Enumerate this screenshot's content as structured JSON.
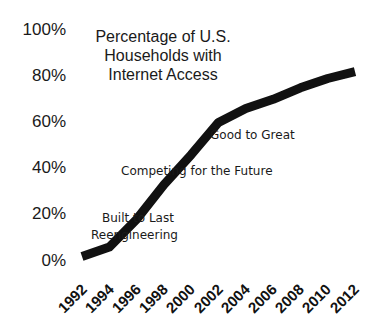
{
  "chart_data": {
    "type": "line",
    "title": "Percentage of U.S. Households with Internet Access",
    "title_lines": [
      "Percentage of U.S.",
      "Households with",
      "Internet Access"
    ],
    "xlabel": "",
    "ylabel": "",
    "x": [
      1992,
      1994,
      1996,
      1998,
      2000,
      2002,
      2004,
      2006,
      2008,
      2010,
      2012
    ],
    "series": [
      {
        "name": "Households with Internet Access",
        "values": [
          2,
          6,
          18,
          33,
          46,
          60,
          66,
          70,
          75,
          79,
          82
        ]
      }
    ],
    "ylim": [
      0,
      100
    ],
    "yticks": [
      "0%",
      "20%",
      "40%",
      "60%",
      "80%",
      "100%"
    ],
    "xticks": [
      "1992",
      "1994",
      "1996",
      "1998",
      "2000",
      "2002",
      "2004",
      "2006",
      "2008",
      "2010",
      "2012"
    ],
    "grid": false,
    "legend": "none",
    "annotations": [
      {
        "text": "Built to Last",
        "x": 1995.5,
        "y": 17
      },
      {
        "text": "Reengineering",
        "x": 1995.5,
        "y": 11
      },
      {
        "text": "Competing for the Future",
        "x": 2000,
        "y": 39
      },
      {
        "text": "Good to Great",
        "x": 2004,
        "y": 55
      }
    ],
    "line_color": "#111111"
  }
}
